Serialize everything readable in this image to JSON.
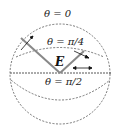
{
  "diagram": {
    "labels": {
      "theta_top": "θ = 0",
      "theta_mid": "θ = π/4",
      "theta_equator": "θ = π/2",
      "field": "E"
    },
    "colors": {
      "dash": "#555555",
      "vector": "#888888",
      "arrow": "#111111"
    }
  }
}
